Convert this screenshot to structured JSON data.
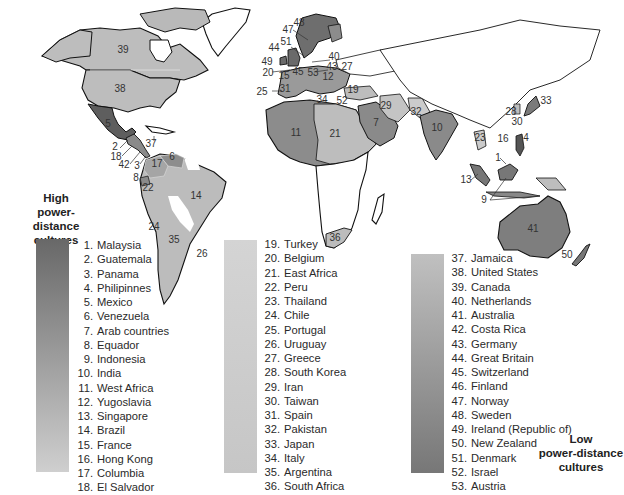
{
  "figure": {
    "type": "choropleth-world-map",
    "shading_colors": {
      "very_dark": "#5e5e5e",
      "dark": "#7c7c7c",
      "medium": "#9a9a9a",
      "light": "#b9b9b9",
      "very_light": "#cfcfcf",
      "no_data": "#ffffff"
    }
  },
  "legend": {
    "high_heading": [
      "High",
      "power-distance",
      "cultures"
    ],
    "low_heading": [
      "Low",
      "power-distance",
      "cultures"
    ],
    "gradients": {
      "col1": {
        "from": "#6a6a6a",
        "to": "#cdcdcd"
      },
      "col2": {
        "from": "#d2d2d2",
        "to": "#c4c4c4"
      },
      "col3": {
        "from": "#bfbfbf",
        "to": "#787878"
      }
    },
    "columns": [
      {
        "items": [
          {
            "n": "1.",
            "name": "Malaysia"
          },
          {
            "n": "2.",
            "name": "Guatemala"
          },
          {
            "n": "3.",
            "name": "Panama"
          },
          {
            "n": "4.",
            "name": "Philipinnes"
          },
          {
            "n": "5.",
            "name": "Mexico"
          },
          {
            "n": "6.",
            "name": "Venezuela"
          },
          {
            "n": "7.",
            "name": "Arab countries"
          },
          {
            "n": "8.",
            "name": "Equador"
          },
          {
            "n": "9.",
            "name": "Indonesia"
          },
          {
            "n": "10.",
            "name": "India"
          },
          {
            "n": "11.",
            "name": "West Africa"
          },
          {
            "n": "12.",
            "name": "Yugoslavia"
          },
          {
            "n": "13.",
            "name": "Singapore"
          },
          {
            "n": "14.",
            "name": "Brazil"
          },
          {
            "n": "15.",
            "name": "France"
          },
          {
            "n": "16.",
            "name": "Hong Kong"
          },
          {
            "n": "17.",
            "name": "Columbia"
          },
          {
            "n": "18.",
            "name": "El Salvador"
          }
        ]
      },
      {
        "items": [
          {
            "n": "19.",
            "name": "Turkey"
          },
          {
            "n": "20.",
            "name": "Belgium"
          },
          {
            "n": "21.",
            "name": "East Africa"
          },
          {
            "n": "22.",
            "name": "Peru"
          },
          {
            "n": "23.",
            "name": "Thailand"
          },
          {
            "n": "24.",
            "name": "Chile"
          },
          {
            "n": "25.",
            "name": "Portugal"
          },
          {
            "n": "26.",
            "name": "Uruguay"
          },
          {
            "n": "27.",
            "name": "Greece"
          },
          {
            "n": "28.",
            "name": "South Korea"
          },
          {
            "n": "29.",
            "name": "Iran"
          },
          {
            "n": "30.",
            "name": "Taiwan"
          },
          {
            "n": "31.",
            "name": "Spain"
          },
          {
            "n": "32.",
            "name": "Pakistan"
          },
          {
            "n": "33.",
            "name": "Japan"
          },
          {
            "n": "34.",
            "name": "Italy"
          },
          {
            "n": "35.",
            "name": "Argentina"
          },
          {
            "n": "36.",
            "name": "South Africa"
          }
        ]
      },
      {
        "items": [
          {
            "n": "37.",
            "name": "Jamaica"
          },
          {
            "n": "38.",
            "name": "United States"
          },
          {
            "n": "39.",
            "name": "Canada"
          },
          {
            "n": "40.",
            "name": "Netherlands"
          },
          {
            "n": "41.",
            "name": "Australia"
          },
          {
            "n": "42.",
            "name": "Costa Rica"
          },
          {
            "n": "43.",
            "name": "Germany"
          },
          {
            "n": "44.",
            "name": "Great Britain"
          },
          {
            "n": "45.",
            "name": "Switzerland"
          },
          {
            "n": "46.",
            "name": "Finland"
          },
          {
            "n": "47.",
            "name": "Norway"
          },
          {
            "n": "48.",
            "name": "Sweden"
          },
          {
            "n": "49.",
            "name": "Ireland (Republic of)"
          },
          {
            "n": "50.",
            "name": "New Zealand"
          },
          {
            "n": "51.",
            "name": "Denmark"
          },
          {
            "n": "52.",
            "name": "Israel"
          },
          {
            "n": "53.",
            "name": "Austria"
          }
        ]
      }
    ]
  },
  "map_labels": [
    {
      "t": "39",
      "x": 123,
      "y": 53
    },
    {
      "t": "38",
      "x": 120,
      "y": 92
    },
    {
      "t": "5",
      "x": 108,
      "y": 127
    },
    {
      "t": "37",
      "x": 151,
      "y": 147
    },
    {
      "t": "2",
      "x": 115,
      "y": 150
    },
    {
      "t": "18",
      "x": 116,
      "y": 160
    },
    {
      "t": "42",
      "x": 124,
      "y": 168
    },
    {
      "t": "3",
      "x": 137,
      "y": 169
    },
    {
      "t": "6",
      "x": 172,
      "y": 160
    },
    {
      "t": "17",
      "x": 157,
      "y": 167
    },
    {
      "t": "8",
      "x": 136,
      "y": 181
    },
    {
      "t": "22",
      "x": 148,
      "y": 191
    },
    {
      "t": "14",
      "x": 196,
      "y": 199
    },
    {
      "t": "24",
      "x": 154,
      "y": 230
    },
    {
      "t": "35",
      "x": 174,
      "y": 243
    },
    {
      "t": "26",
      "x": 202,
      "y": 257
    },
    {
      "t": "48",
      "x": 299,
      "y": 26
    },
    {
      "t": "47",
      "x": 288,
      "y": 33
    },
    {
      "t": "51",
      "x": 286,
      "y": 45
    },
    {
      "t": "44",
      "x": 274,
      "y": 51
    },
    {
      "t": "49",
      "x": 267,
      "y": 65
    },
    {
      "t": "40",
      "x": 334,
      "y": 60
    },
    {
      "t": "20",
      "x": 268,
      "y": 76
    },
    {
      "t": "43",
      "x": 332,
      "y": 70
    },
    {
      "t": "27",
      "x": 347,
      "y": 70
    },
    {
      "t": "15",
      "x": 284,
      "y": 79
    },
    {
      "t": "45",
      "x": 298,
      "y": 75
    },
    {
      "t": "53",
      "x": 313,
      "y": 76
    },
    {
      "t": "12",
      "x": 328,
      "y": 80
    },
    {
      "t": "25",
      "x": 262,
      "y": 95
    },
    {
      "t": "31",
      "x": 285,
      "y": 92
    },
    {
      "t": "19",
      "x": 353,
      "y": 93
    },
    {
      "t": "34",
      "x": 322,
      "y": 103
    },
    {
      "t": "52",
      "x": 342,
      "y": 104
    },
    {
      "t": "29",
      "x": 386,
      "y": 109
    },
    {
      "t": "32",
      "x": 416,
      "y": 115
    },
    {
      "t": "7",
      "x": 376,
      "y": 126
    },
    {
      "t": "11",
      "x": 296,
      "y": 136
    },
    {
      "t": "21",
      "x": 335,
      "y": 137
    },
    {
      "t": "10",
      "x": 437,
      "y": 131
    },
    {
      "t": "33",
      "x": 546,
      "y": 104
    },
    {
      "t": "28",
      "x": 511,
      "y": 115
    },
    {
      "t": "30",
      "x": 517,
      "y": 125
    },
    {
      "t": "16",
      "x": 503,
      "y": 142
    },
    {
      "t": "4",
      "x": 526,
      "y": 141
    },
    {
      "t": "23",
      "x": 480,
      "y": 141
    },
    {
      "t": "1",
      "x": 498,
      "y": 161
    },
    {
      "t": "13",
      "x": 466,
      "y": 183
    },
    {
      "t": "9",
      "x": 484,
      "y": 203
    },
    {
      "t": "41",
      "x": 533,
      "y": 232
    },
    {
      "t": "50",
      "x": 567,
      "y": 258
    },
    {
      "t": "36",
      "x": 335,
      "y": 241
    }
  ]
}
